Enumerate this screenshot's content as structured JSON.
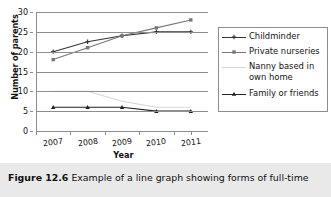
{
  "caption": {
    "figure_number": "Figure 12.6",
    "text": "Example of a line graph showing forms of full-time"
  },
  "legend": {
    "position": "right",
    "items": [
      {
        "label": "Childminder",
        "color": "#333333",
        "marker": "plus-cross-icon"
      },
      {
        "label": "Private nurseries",
        "color": "#777777",
        "marker": "square-icon"
      },
      {
        "label": "Nanny based in\nown home",
        "color": "#d6d6d6",
        "marker": "none-icon"
      },
      {
        "label": "Family or friends",
        "color": "#222222",
        "marker": "triangle-icon"
      }
    ]
  },
  "chart_data": {
    "type": "line",
    "title": "",
    "xlabel": "Year",
    "ylabel": "Number of parents",
    "categories": [
      "2007",
      "2008",
      "2009",
      "2010",
      "2011"
    ],
    "ylim": [
      0,
      30
    ],
    "yticks": [
      0,
      5,
      10,
      15,
      20,
      25,
      30
    ],
    "grid": true,
    "legend_position": "right",
    "series": [
      {
        "name": "Childminder",
        "color": "#333333",
        "marker": "plus",
        "values": [
          20,
          22.5,
          24,
          25,
          25
        ]
      },
      {
        "name": "Private nurseries",
        "color": "#777777",
        "marker": "square",
        "values": [
          18,
          21,
          24,
          26,
          28
        ]
      },
      {
        "name": "Nanny based in own home",
        "color": "#d6d6d6",
        "marker": "none",
        "values": [
          10,
          10,
          7.5,
          6,
          6
        ]
      },
      {
        "name": "Family or friends",
        "color": "#222222",
        "marker": "triangle",
        "values": [
          6,
          6,
          6,
          5,
          5
        ]
      }
    ]
  }
}
